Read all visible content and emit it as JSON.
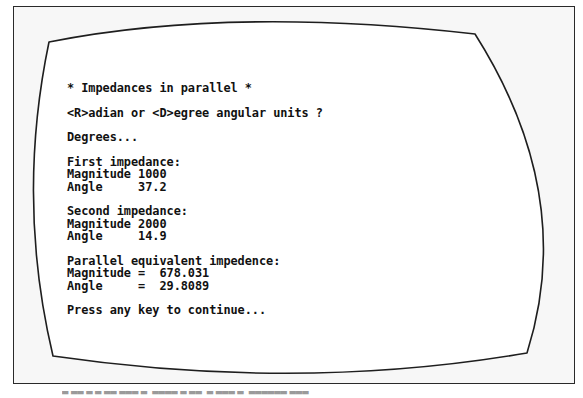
{
  "screen": {
    "lines": [
      "* Impedances in parallel *",
      "",
      "<R>adian or <D>egree angular units ?",
      "",
      "Degrees...",
      "",
      "First impedance:",
      "Magnitude 1000",
      "Angle     37.2",
      "",
      "Second impedance:",
      "Magnitude 2000",
      "Angle     14.9",
      "",
      "Parallel equivalent impedence:",
      "Magnitude =  678.031",
      "Angle     =  29.8089",
      "",
      "Press any key to continue..."
    ]
  },
  "program": {
    "title": "* Impedances in parallel *",
    "units_prompt": "<R>adian or <D>egree angular units ?",
    "units_selected": "Degrees...",
    "first_impedance": {
      "heading": "First impedance:",
      "magnitude_label": "Magnitude",
      "magnitude": "1000",
      "angle_label": "Angle",
      "angle": "37.2"
    },
    "second_impedance": {
      "heading": "Second impedance:",
      "magnitude_label": "Magnitude",
      "magnitude": "2000",
      "angle_label": "Angle",
      "angle": "14.9"
    },
    "result": {
      "heading": "Parallel equivalent impedence:",
      "magnitude_label": "Magnitude =",
      "magnitude": "678.031",
      "angle_label": "Angle     =",
      "angle": "29.8089"
    },
    "continue_prompt": "Press any key to continue..."
  },
  "colors": {
    "text": "#111111",
    "outline": "#2a2a2a",
    "frame_bg": "#f7f7f7",
    "screen_bg": "#ffffff"
  }
}
